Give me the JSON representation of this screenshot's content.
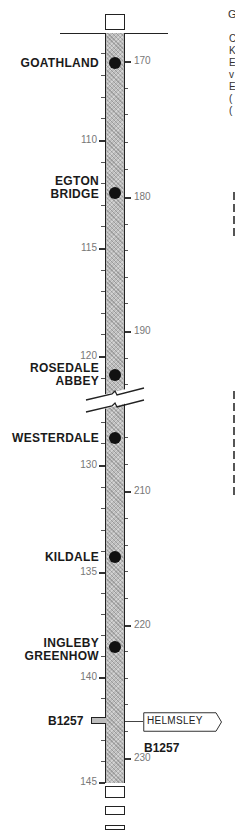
{
  "title_fragment": "G",
  "road_labels": {
    "junction_left": "B1257",
    "junction_right": "B1257",
    "destination_sign": "HELMSLEY"
  },
  "places": [
    {
      "name_line1": "GOATHLAND",
      "name_line2": ""
    },
    {
      "name_line1": "EGTON",
      "name_line2": "BRIDGE"
    },
    {
      "name_line1": "ROSEDALE",
      "name_line2": "ABBEY"
    },
    {
      "name_line1": "WESTERDALE",
      "name_line2": ""
    },
    {
      "name_line1": "KILDALE",
      "name_line2": ""
    },
    {
      "name_line1": "INGLEBY",
      "name_line2": "GREENHOW"
    }
  ],
  "miles_left": [
    "110",
    "115",
    "120",
    "130",
    "135",
    "140",
    "145"
  ],
  "km_right": [
    "170",
    "180",
    "190",
    "210",
    "220",
    "230"
  ],
  "edge_text_fragments": [
    "C",
    "K",
    "E",
    "v",
    "E",
    "(",
    "("
  ],
  "colors": {
    "road_fill": "#bdbdbd",
    "ink": "#1a1a1a",
    "tick_text": "#777777"
  }
}
